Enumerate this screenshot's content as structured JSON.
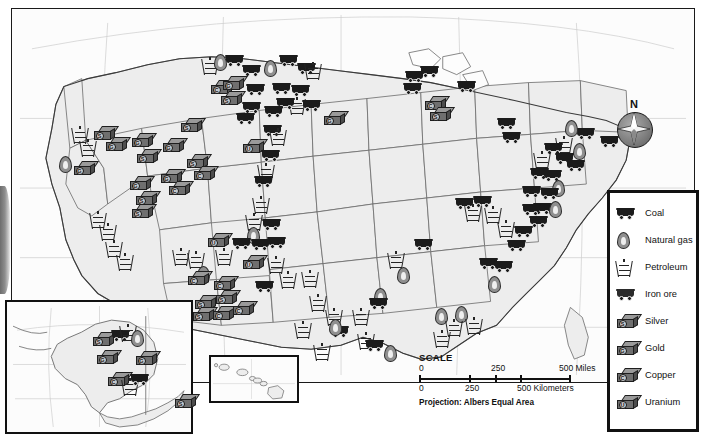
{
  "top_sliver_text": "",
  "map": {
    "title": "",
    "projection_note": "Projection: Albers Equal Area",
    "compass_label": "N"
  },
  "scale": {
    "title": "SCALE",
    "miles": {
      "ticks": [
        "0",
        "250",
        "500 Miles"
      ]
    },
    "kilometers": {
      "ticks": [
        "0",
        "250",
        "500 Kilometers"
      ]
    }
  },
  "legend": {
    "items": [
      {
        "key": "coal",
        "label": "Coal",
        "icon": "coal-cart-icon"
      },
      {
        "key": "natural_gas",
        "label": "Natural gas",
        "icon": "gas-flame-icon"
      },
      {
        "key": "petroleum",
        "label": "Petroleum",
        "icon": "oil-derrick-icon"
      },
      {
        "key": "iron_ore",
        "label": "Iron ore",
        "icon": "iron-ore-cart-icon"
      },
      {
        "key": "silver",
        "label": "Silver",
        "icon": "silver-ingot-icon",
        "badge": "S"
      },
      {
        "key": "gold",
        "label": "Gold",
        "icon": "gold-ingot-icon",
        "badge": "G"
      },
      {
        "key": "copper",
        "label": "Copper",
        "icon": "copper-ingot-icon",
        "badge": "C"
      },
      {
        "key": "uranium",
        "label": "Uranium",
        "icon": "uranium-ingot-icon",
        "badge": "U"
      }
    ]
  },
  "insets": [
    {
      "key": "alaska",
      "name": "alaska-inset"
    },
    {
      "key": "hawaii",
      "name": "hawaii-inset"
    }
  ],
  "colors": {
    "land": "#ededed",
    "border": "#1a1a1a",
    "ingot_face": "#6f6f6f",
    "ingot_top": "#9a9a9a",
    "cart": "#1b1b1b",
    "flame": "#8f8f8f"
  },
  "symbols": {
    "mainland": [
      {
        "t": "derrick",
        "x": 62,
        "y": 118
      },
      {
        "t": "derrick",
        "x": 70,
        "y": 131
      },
      {
        "t": "derrick",
        "x": 80,
        "y": 203
      },
      {
        "t": "derrick",
        "x": 90,
        "y": 215
      },
      {
        "t": "derrick",
        "x": 96,
        "y": 232
      },
      {
        "t": "derrick",
        "x": 107,
        "y": 245
      },
      {
        "t": "flame",
        "x": 48,
        "y": 148
      },
      {
        "t": "ingot",
        "b": "G",
        "x": 63,
        "y": 153
      },
      {
        "t": "ingot",
        "b": "S",
        "x": 83,
        "y": 118
      },
      {
        "t": "ingot",
        "b": "G",
        "x": 95,
        "y": 129
      },
      {
        "t": "ingot",
        "b": "G",
        "x": 121,
        "y": 125
      },
      {
        "t": "ingot",
        "b": "S",
        "x": 126,
        "y": 141
      },
      {
        "t": "ingot",
        "b": "G",
        "x": 119,
        "y": 168
      },
      {
        "t": "ingot",
        "b": "S",
        "x": 125,
        "y": 183
      },
      {
        "t": "ingot",
        "b": "G",
        "x": 152,
        "y": 130
      },
      {
        "t": "ingot",
        "b": "G",
        "x": 150,
        "y": 161
      },
      {
        "t": "ingot",
        "b": "C",
        "x": 158,
        "y": 173
      },
      {
        "t": "ingot",
        "b": "S",
        "x": 170,
        "y": 110
      },
      {
        "t": "ingot",
        "b": "S",
        "x": 176,
        "y": 146
      },
      {
        "t": "ingot",
        "b": "C",
        "x": 183,
        "y": 158
      },
      {
        "t": "derrick",
        "x": 192,
        "y": 49
      },
      {
        "t": "flame",
        "x": 203,
        "y": 46
      },
      {
        "t": "cart",
        "x": 215,
        "y": 47
      },
      {
        "t": "cart",
        "x": 232,
        "y": 57
      },
      {
        "t": "flame",
        "x": 253,
        "y": 52
      },
      {
        "t": "cart",
        "x": 269,
        "y": 47
      },
      {
        "t": "cart",
        "x": 287,
        "y": 55
      },
      {
        "t": "derrick",
        "x": 295,
        "y": 54
      },
      {
        "t": "cart",
        "x": 236,
        "y": 76
      },
      {
        "t": "ingot",
        "b": "C",
        "x": 200,
        "y": 72
      },
      {
        "t": "ingot",
        "b": "G",
        "x": 212,
        "y": 68
      },
      {
        "t": "ingot",
        "b": "S",
        "x": 210,
        "y": 83
      },
      {
        "t": "cart",
        "x": 262,
        "y": 75
      },
      {
        "t": "cart",
        "x": 281,
        "y": 77
      },
      {
        "t": "derrick",
        "x": 279,
        "y": 89
      },
      {
        "t": "cart",
        "x": 266,
        "y": 90
      },
      {
        "t": "cart",
        "x": 254,
        "y": 98
      },
      {
        "t": "cart",
        "x": 292,
        "y": 92
      },
      {
        "t": "cart",
        "x": 232,
        "y": 94
      },
      {
        "t": "cart",
        "x": 226,
        "y": 105
      },
      {
        "t": "ingot",
        "b": "G",
        "x": 313,
        "y": 103
      },
      {
        "t": "cart",
        "x": 253,
        "y": 117
      },
      {
        "t": "derrick",
        "x": 260,
        "y": 120
      },
      {
        "t": "ingot",
        "b": "U",
        "x": 232,
        "y": 131
      },
      {
        "t": "cart",
        "x": 251,
        "y": 142
      },
      {
        "t": "derrick",
        "x": 248,
        "y": 155
      },
      {
        "t": "cart",
        "x": 244,
        "y": 168
      },
      {
        "t": "derrick",
        "x": 243,
        "y": 188
      },
      {
        "t": "derrick",
        "x": 236,
        "y": 205
      },
      {
        "t": "flame",
        "x": 236,
        "y": 219
      },
      {
        "t": "cart",
        "x": 252,
        "y": 211
      },
      {
        "t": "cart",
        "x": 257,
        "y": 229
      },
      {
        "t": "derrick",
        "x": 258,
        "y": 248
      },
      {
        "t": "derrick",
        "x": 270,
        "y": 263
      },
      {
        "t": "derrick",
        "x": 292,
        "y": 262
      },
      {
        "t": "derrick",
        "x": 300,
        "y": 286
      },
      {
        "t": "derrick",
        "x": 316,
        "y": 300
      },
      {
        "t": "cart",
        "x": 320,
        "y": 318
      },
      {
        "t": "derrick",
        "x": 285,
        "y": 313
      },
      {
        "t": "derrick",
        "x": 163,
        "y": 240
      },
      {
        "t": "derrick",
        "x": 178,
        "y": 243
      },
      {
        "t": "derrick",
        "x": 206,
        "y": 240
      },
      {
        "t": "flame",
        "x": 186,
        "y": 258
      },
      {
        "t": "ingot",
        "b": "U",
        "x": 197,
        "y": 225
      },
      {
        "t": "cart",
        "x": 222,
        "y": 230
      },
      {
        "t": "cart",
        "x": 241,
        "y": 231
      },
      {
        "t": "ingot",
        "b": "U",
        "x": 232,
        "y": 247
      },
      {
        "t": "ingot",
        "b": "C",
        "x": 177,
        "y": 263
      },
      {
        "t": "ingot",
        "b": "C",
        "x": 203,
        "y": 268
      },
      {
        "t": "ingot",
        "b": "S",
        "x": 184,
        "y": 287
      },
      {
        "t": "ingot",
        "b": "S",
        "x": 205,
        "y": 282
      },
      {
        "t": "ingot",
        "b": "S",
        "x": 182,
        "y": 299
      },
      {
        "t": "ingot",
        "b": "C",
        "x": 202,
        "y": 298
      },
      {
        "t": "ingot",
        "b": "C",
        "x": 222,
        "y": 293
      },
      {
        "t": "cart",
        "x": 245,
        "y": 273
      },
      {
        "t": "ingot",
        "b": "S",
        "x": 121,
        "y": 196
      },
      {
        "t": "cart",
        "x": 395,
        "y": 63
      },
      {
        "t": "cart",
        "x": 410,
        "y": 58
      },
      {
        "t": "cart",
        "x": 393,
        "y": 75
      },
      {
        "t": "cart",
        "x": 447,
        "y": 73
      },
      {
        "t": "ingot",
        "b": "C",
        "x": 414,
        "y": 88
      },
      {
        "t": "ingot",
        "b": "S",
        "x": 419,
        "y": 99
      },
      {
        "t": "cart",
        "x": 487,
        "y": 110
      },
      {
        "t": "cart",
        "x": 492,
        "y": 124
      },
      {
        "t": "cart",
        "x": 566,
        "y": 120
      },
      {
        "t": "cart",
        "x": 590,
        "y": 128
      },
      {
        "t": "flame",
        "x": 554,
        "y": 112
      },
      {
        "t": "derrick",
        "x": 546,
        "y": 128
      },
      {
        "t": "cart",
        "x": 534,
        "y": 135
      },
      {
        "t": "flame",
        "x": 562,
        "y": 135
      },
      {
        "t": "cart",
        "x": 545,
        "y": 145
      },
      {
        "t": "derrick",
        "x": 524,
        "y": 143
      },
      {
        "t": "cart",
        "x": 556,
        "y": 152
      },
      {
        "t": "cart",
        "x": 520,
        "y": 160
      },
      {
        "t": "cart",
        "x": 533,
        "y": 162
      },
      {
        "t": "flame",
        "x": 541,
        "y": 172
      },
      {
        "t": "cart",
        "x": 530,
        "y": 180
      },
      {
        "t": "cart",
        "x": 512,
        "y": 178
      },
      {
        "t": "cart",
        "x": 523,
        "y": 195
      },
      {
        "t": "flame",
        "x": 538,
        "y": 193
      },
      {
        "t": "cart",
        "x": 512,
        "y": 196
      },
      {
        "t": "cart",
        "x": 519,
        "y": 208
      },
      {
        "t": "cart",
        "x": 445,
        "y": 190
      },
      {
        "t": "cart",
        "x": 463,
        "y": 188
      },
      {
        "t": "derrick",
        "x": 455,
        "y": 196
      },
      {
        "t": "derrick",
        "x": 475,
        "y": 198
      },
      {
        "t": "derrick",
        "x": 488,
        "y": 212
      },
      {
        "t": "cart",
        "x": 504,
        "y": 218
      },
      {
        "t": "cart",
        "x": 497,
        "y": 232
      },
      {
        "t": "cart",
        "x": 404,
        "y": 231
      },
      {
        "t": "cart",
        "x": 469,
        "y": 250
      },
      {
        "t": "cart",
        "x": 484,
        "y": 253
      },
      {
        "t": "flame",
        "x": 477,
        "y": 268
      },
      {
        "t": "derrick",
        "x": 378,
        "y": 243
      },
      {
        "t": "flame",
        "x": 386,
        "y": 259
      },
      {
        "t": "flame",
        "x": 363,
        "y": 280
      },
      {
        "t": "flame",
        "x": 424,
        "y": 300
      },
      {
        "t": "flame",
        "x": 444,
        "y": 298
      },
      {
        "t": "derrick",
        "x": 436,
        "y": 311
      },
      {
        "t": "derrick",
        "x": 456,
        "y": 309
      },
      {
        "t": "derrick",
        "x": 424,
        "y": 322
      },
      {
        "t": "derrick",
        "x": 348,
        "y": 324
      },
      {
        "t": "derrick",
        "x": 343,
        "y": 300
      },
      {
        "t": "cart",
        "x": 355,
        "y": 332
      },
      {
        "t": "flame",
        "x": 373,
        "y": 337
      },
      {
        "t": "cart",
        "x": 359,
        "y": 290
      },
      {
        "t": "derrick",
        "x": 304,
        "y": 335
      },
      {
        "t": "flame",
        "x": 318,
        "y": 311
      }
    ],
    "alaska": [
      {
        "t": "ingot",
        "b": "S",
        "x": 86,
        "y": 30
      },
      {
        "t": "cart",
        "x": 105,
        "y": 28
      },
      {
        "t": "derrick",
        "x": 114,
        "y": 22
      },
      {
        "t": "flame",
        "x": 124,
        "y": 28
      },
      {
        "t": "ingot",
        "b": "G",
        "x": 90,
        "y": 48
      },
      {
        "t": "ingot",
        "b": "G",
        "x": 129,
        "y": 49
      },
      {
        "t": "ingot",
        "b": "C",
        "x": 101,
        "y": 70
      },
      {
        "t": "derrick",
        "x": 116,
        "y": 76
      },
      {
        "t": "cart",
        "x": 124,
        "y": 72
      },
      {
        "t": "ingot",
        "b": "S",
        "x": 168,
        "y": 92
      }
    ],
    "hawaii": []
  }
}
